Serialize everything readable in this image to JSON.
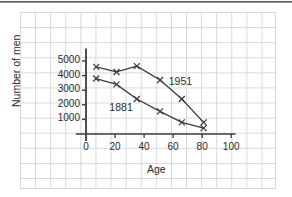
{
  "figure": {
    "background_color": "#ffffff",
    "grid_color": "#d8d8d8",
    "line_color": "#3c3c3c",
    "text_color": "#2b2b2b"
  },
  "chart_data": {
    "type": "line",
    "title": "",
    "xlabel": "Age",
    "ylabel": "Number of men",
    "xlim": [
      -8,
      112
    ],
    "ylim": [
      0,
      5800
    ],
    "xticks": [
      0,
      20,
      40,
      60,
      80,
      100
    ],
    "xtick_labels": [
      "0",
      "20",
      "40",
      "60",
      "80",
      "100"
    ],
    "yticks": [
      1000,
      2000,
      3000,
      4000,
      5000
    ],
    "ytick_labels": [
      "1000",
      "2000",
      "3000",
      "4000",
      "5000"
    ],
    "grid": true,
    "grid_style": "graph-paper",
    "legend": "inline-annotations",
    "marker": "x",
    "series": [
      {
        "name": "1951",
        "label": "1951",
        "label_x": 57,
        "label_y": 3550,
        "x": [
          7,
          21,
          35,
          51,
          66,
          81
        ],
        "y": [
          4600,
          4250,
          4650,
          3700,
          2400,
          800
        ]
      },
      {
        "name": "1881",
        "label": "1881",
        "label_x": 34,
        "label_y": 1750,
        "label_anchor": "end",
        "x": [
          7,
          21,
          35,
          51,
          66,
          81
        ],
        "y": [
          3800,
          3400,
          2400,
          1550,
          800,
          400
        ]
      }
    ]
  }
}
